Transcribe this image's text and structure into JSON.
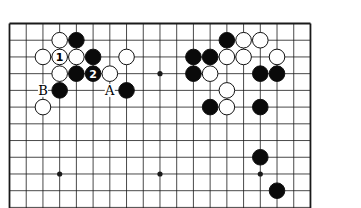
{
  "diagram": {
    "type": "go-board",
    "size": 19,
    "visible_rows": 12,
    "colors": {
      "line": "#1a1a1a",
      "black": "#0a0a0a",
      "white": "#ffffff",
      "background": "#ffffff"
    },
    "star_points": [
      [
        3,
        3
      ],
      [
        9,
        3
      ],
      [
        15,
        3
      ],
      [
        3,
        9
      ],
      [
        9,
        9
      ],
      [
        15,
        9
      ]
    ],
    "stones": [
      {
        "c": 3,
        "r": 1,
        "color": "white"
      },
      {
        "c": 4,
        "r": 1,
        "color": "black"
      },
      {
        "c": 2,
        "r": 2,
        "color": "white"
      },
      {
        "c": 3,
        "r": 2,
        "color": "white",
        "label": "1"
      },
      {
        "c": 4,
        "r": 2,
        "color": "white"
      },
      {
        "c": 5,
        "r": 2,
        "color": "black"
      },
      {
        "c": 7,
        "r": 2,
        "color": "white"
      },
      {
        "c": 3,
        "r": 3,
        "color": "white"
      },
      {
        "c": 4,
        "r": 3,
        "color": "black"
      },
      {
        "c": 5,
        "r": 3,
        "color": "black",
        "label": "2"
      },
      {
        "c": 6,
        "r": 3,
        "color": "white"
      },
      {
        "c": 3,
        "r": 4,
        "color": "black"
      },
      {
        "c": 7,
        "r": 4,
        "color": "black"
      },
      {
        "c": 2,
        "r": 5,
        "color": "white"
      },
      {
        "c": 13,
        "r": 1,
        "color": "black"
      },
      {
        "c": 14,
        "r": 1,
        "color": "white"
      },
      {
        "c": 15,
        "r": 1,
        "color": "white"
      },
      {
        "c": 11,
        "r": 2,
        "color": "black"
      },
      {
        "c": 12,
        "r": 2,
        "color": "black"
      },
      {
        "c": 13,
        "r": 2,
        "color": "white"
      },
      {
        "c": 14,
        "r": 2,
        "color": "white"
      },
      {
        "c": 16,
        "r": 2,
        "color": "white"
      },
      {
        "c": 11,
        "r": 3,
        "color": "black"
      },
      {
        "c": 12,
        "r": 3,
        "color": "white"
      },
      {
        "c": 15,
        "r": 3,
        "color": "black"
      },
      {
        "c": 16,
        "r": 3,
        "color": "black"
      },
      {
        "c": 13,
        "r": 4,
        "color": "white"
      },
      {
        "c": 12,
        "r": 5,
        "color": "black"
      },
      {
        "c": 13,
        "r": 5,
        "color": "white"
      },
      {
        "c": 15,
        "r": 5,
        "color": "black"
      },
      {
        "c": 15,
        "r": 8,
        "color": "black"
      },
      {
        "c": 16,
        "r": 10,
        "color": "black"
      }
    ],
    "point_labels": [
      {
        "c": 2,
        "r": 4,
        "text": "B"
      },
      {
        "c": 6,
        "r": 4,
        "text": "A"
      }
    ]
  }
}
